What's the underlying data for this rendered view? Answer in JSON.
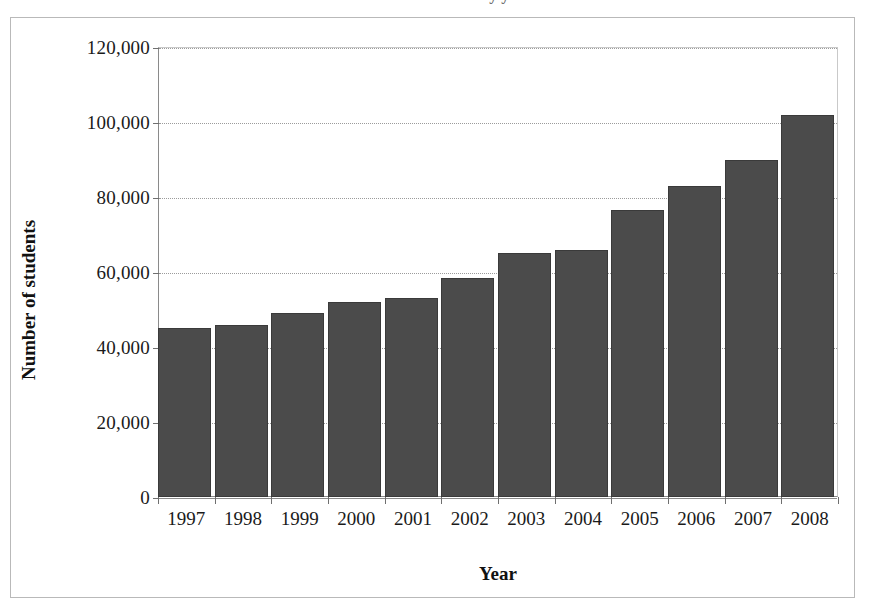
{
  "figure": {
    "clipped_title": "Number of students by year",
    "frame_color": "#b9b9b9"
  },
  "axes": {
    "y_title": "Number of students",
    "x_title": "Year",
    "y_ticks": [
      "0",
      "20,000",
      "40,000",
      "60,000",
      "80,000",
      "100,000",
      "120,000"
    ],
    "y_tick_values": [
      0,
      20000,
      40000,
      60000,
      80000,
      100000,
      120000
    ]
  },
  "chart_data": {
    "type": "bar",
    "title": "",
    "xlabel": "Year",
    "ylabel": "Number of students",
    "categories": [
      "1997",
      "1998",
      "1999",
      "2000",
      "2001",
      "2002",
      "2003",
      "2004",
      "2005",
      "2006",
      "2007",
      "2008"
    ],
    "values": [
      45000,
      46000,
      49000,
      52000,
      53000,
      58500,
      65000,
      66000,
      76500,
      83000,
      90000,
      102000
    ],
    "ylim": [
      0,
      120000
    ],
    "yticks": [
      0,
      20000,
      40000,
      60000,
      80000,
      100000,
      120000
    ],
    "grid": true,
    "grid_axis": "y",
    "grid_style": "dotted",
    "legend": false,
    "bar_color": "#4b4b4b",
    "bar_pattern": "fine-dither-texture"
  }
}
